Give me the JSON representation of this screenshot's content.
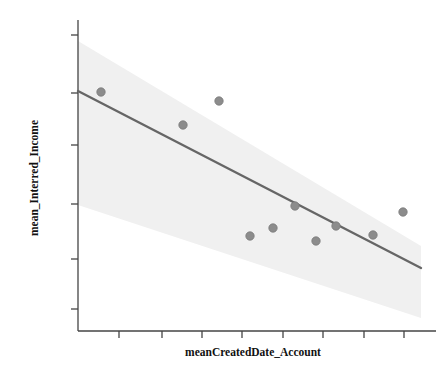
{
  "chart_data": {
    "type": "scatter",
    "title": "",
    "xlabel": "meanCreatedDate_Account",
    "ylabel": "mean_Interred_Income",
    "grid": false,
    "legend": null,
    "xlim": [
      0,
      1
    ],
    "ylim": [
      0,
      1
    ],
    "x_tick_labels": [
      "",
      "",
      "",
      "",
      "",
      "",
      "",
      ""
    ],
    "y_tick_labels": [
      "",
      "",
      "",
      "",
      "",
      ""
    ],
    "x_tick_positions": [
      119,
      162,
      202,
      242,
      283,
      323,
      364,
      404
    ],
    "y_tick_positions": [
      35,
      93,
      145,
      204,
      259,
      309
    ],
    "points": [
      {
        "x": 101,
        "y": 92
      },
      {
        "x": 183,
        "y": 125
      },
      {
        "x": 219,
        "y": 101
      },
      {
        "x": 250,
        "y": 236
      },
      {
        "x": 273,
        "y": 228
      },
      {
        "x": 295,
        "y": 206
      },
      {
        "x": 316,
        "y": 241
      },
      {
        "x": 336,
        "y": 226
      },
      {
        "x": 373,
        "y": 235
      },
      {
        "x": 403,
        "y": 212
      }
    ],
    "fit_line": {
      "x1": 78,
      "y1": 91,
      "x2": 421,
      "y2": 268
    },
    "confidence_band": {
      "upper": [
        [
          78,
          41
        ],
        [
          421,
          246
        ]
      ],
      "lower": [
        [
          78,
          205
        ],
        [
          421,
          318
        ]
      ]
    },
    "colors": {
      "point_fill": "#8c8c8c",
      "point_stroke": "#7a7a7a",
      "line": "#666666",
      "band": "#f0f0f0",
      "axis": "#444444",
      "text": "#111111",
      "background": "#ffffff"
    },
    "series_name": "observations",
    "n_points": 10
  },
  "plot": {
    "axis_left_x": 78,
    "axis_bottom_y": 331,
    "axis_top_y": 20,
    "axis_right_x": 436
  }
}
